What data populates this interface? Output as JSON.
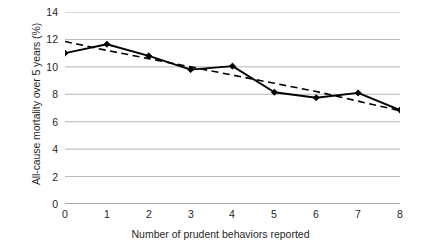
{
  "chart_data": {
    "type": "line",
    "title": "",
    "xlabel": "Number of prudent behaviors reported",
    "ylabel": "All-cause mortality over 5 years (%)",
    "x": [
      0,
      1,
      2,
      3,
      4,
      5,
      6,
      7,
      8
    ],
    "xlim": [
      -0.45,
      8.45
    ],
    "ylim": [
      0,
      14
    ],
    "xticks": [
      "0",
      "1",
      "2",
      "3",
      "4",
      "5",
      "6",
      "7",
      "8"
    ],
    "yticks": [
      "0",
      "2",
      "4",
      "6",
      "8",
      "10",
      "12",
      "14"
    ],
    "ytick_values": [
      0,
      2,
      4,
      6,
      8,
      10,
      12,
      14
    ],
    "grid": "horizontal",
    "legend": "none",
    "series": [
      {
        "name": "Observed mortality",
        "style": "solid-with-diamond-markers",
        "color": "#000000",
        "values": [
          11.0,
          11.65,
          10.8,
          9.8,
          10.05,
          8.15,
          7.75,
          8.1,
          6.85
        ]
      },
      {
        "name": "Linear trend",
        "style": "dashed",
        "color": "#000000",
        "values": [
          11.85,
          11.2,
          10.6,
          10.0,
          9.4,
          8.8,
          8.2,
          7.5,
          6.8
        ]
      }
    ]
  },
  "colors": {
    "grid": "#b5b5b5",
    "axis": "#555555",
    "data": "#000000",
    "text": "#1f1f1f",
    "background": "#ffffff"
  }
}
